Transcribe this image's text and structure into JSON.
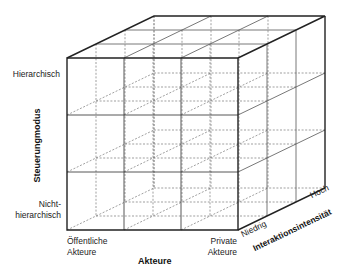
{
  "diagram": {
    "type": "3d-cube-matrix",
    "divisions": {
      "x": 3,
      "y": 3,
      "z": 3
    },
    "axes": {
      "x": {
        "title": "Akteure",
        "low": "Öffentliche\nAkteure",
        "low_line1": "Öffentliche",
        "low_line2": "Akteure",
        "high_line1": "Private",
        "high_line2": "Akteure"
      },
      "y": {
        "title": "Steuerungmodus",
        "high": "Hierarchisch",
        "low_line1": "Nicht-",
        "low_line2": "hierarchisch"
      },
      "z": {
        "title": "Interaktionsintensität",
        "low": "Niedrig",
        "high": "Hoch"
      }
    },
    "colors": {
      "solid_line": "#333333",
      "inner_line": "#555555",
      "dashed_line": "#777777",
      "text": "#222222"
    }
  }
}
